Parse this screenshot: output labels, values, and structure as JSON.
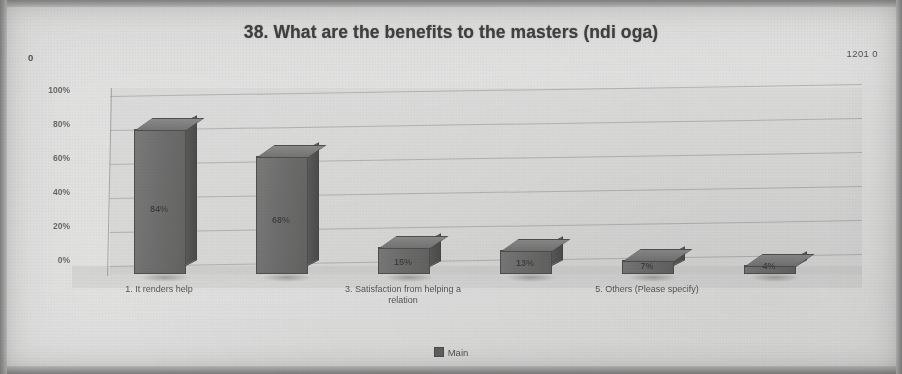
{
  "chart_data": {
    "type": "bar",
    "title": "38. What are the benefits to the masters (ndi oga)",
    "xlabel": "",
    "ylabel": "",
    "ylim": [
      0,
      100
    ],
    "grid": true,
    "legend_position": "bottom",
    "legend": [
      "Main"
    ],
    "categories": [
      "1. It renders help",
      "2.",
      "3. Satisfaction from helping a relation",
      "4.",
      "5. Others (Please specify)",
      "6."
    ],
    "visible_tick_labels": [
      "1. It renders help",
      "3. Satisfaction from helping a relation",
      "5. Others (Please specify)"
    ],
    "ytick_labels": [
      "100%",
      "80%",
      "60%",
      "40%",
      "20%",
      "0%"
    ],
    "series": [
      {
        "name": "Main",
        "values": [
          84,
          68,
          15,
          13,
          7,
          4
        ],
        "data_labels": [
          "84%",
          "68%",
          "15%",
          "13%",
          "7%",
          "4%"
        ]
      }
    ]
  },
  "annotations": {
    "top_left": "0",
    "top_right": "1201 0"
  },
  "colors": {
    "bar_fill": "#6f6d69",
    "bar_top": "#8d8b87",
    "bar_side": "#545250",
    "paper": "#e9e7e2",
    "text": "#3a3a38"
  }
}
